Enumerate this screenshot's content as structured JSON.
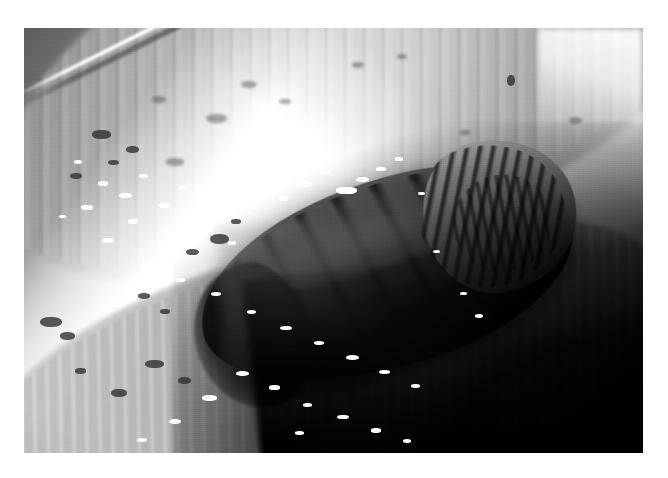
{
  "page": {
    "background_color": "#ffffff",
    "width": 668,
    "height": 478
  },
  "photo": {
    "alt_text": "Grayscale macro photograph of an insect pupa lying in a plant leaf sheath",
    "subject": "insect pupa",
    "medium": "black and white macro photograph",
    "frame": {
      "left": 24,
      "top": 28,
      "width": 619,
      "height": 425
    },
    "colors": {
      "paper": "#ffffff",
      "highlight": "#ffffff",
      "leaf_mid": "#b4b4b4",
      "leaf_dark": "#5d5d5d",
      "pupa_body": "#6e6e6e",
      "pupa_groove": "#141414",
      "shadow": "#000000"
    },
    "regions": [
      {
        "name": "upper-leaf-blade",
        "tone": "mid gray, blurred, longitudinal striations"
      },
      {
        "name": "leaf-edge-highlight",
        "tone": "bright white rim line running diagonally"
      },
      {
        "name": "blown-highlight-band",
        "tone": "overexposed white band, left of centre"
      },
      {
        "name": "pupa",
        "tone": "segmented dark gray body, head to upper right"
      },
      {
        "name": "lower-leaf-sheath",
        "tone": "mid gray with white speckles"
      },
      {
        "name": "shadow-wedge",
        "tone": "deep black, lower right corner"
      }
    ],
    "specular_highlights": [
      {
        "x": 44.0,
        "y": 36.0,
        "w": 2.6,
        "h": 1.5
      },
      {
        "x": 47.8,
        "y": 33.2,
        "w": 1.8,
        "h": 1.2
      },
      {
        "x": 50.4,
        "y": 37.4,
        "w": 3.4,
        "h": 1.7
      },
      {
        "x": 53.6,
        "y": 35.0,
        "w": 2.2,
        "h": 1.3
      },
      {
        "x": 56.8,
        "y": 32.6,
        "w": 1.7,
        "h": 1.1
      },
      {
        "x": 41.2,
        "y": 39.6,
        "w": 1.5,
        "h": 1.0
      },
      {
        "x": 60.0,
        "y": 30.4,
        "w": 1.3,
        "h": 0.9
      },
      {
        "x": 63.6,
        "y": 38.6,
        "w": 1.2,
        "h": 0.8
      },
      {
        "x": 37.0,
        "y": 42.0,
        "w": 1.1,
        "h": 0.8
      }
    ],
    "leaf_dew": [
      {
        "x": 12.0,
        "y": 36.0,
        "w": 1.6,
        "h": 1.1
      },
      {
        "x": 15.4,
        "y": 38.8,
        "w": 2.1,
        "h": 1.2
      },
      {
        "x": 18.6,
        "y": 34.4,
        "w": 1.4,
        "h": 1.0
      },
      {
        "x": 21.8,
        "y": 41.2,
        "w": 1.8,
        "h": 1.1
      },
      {
        "x": 25.0,
        "y": 37.0,
        "w": 1.3,
        "h": 0.9
      },
      {
        "x": 9.2,
        "y": 41.6,
        "w": 1.9,
        "h": 1.2
      },
      {
        "x": 28.4,
        "y": 43.8,
        "w": 1.5,
        "h": 1.0
      },
      {
        "x": 31.6,
        "y": 39.2,
        "w": 1.2,
        "h": 0.8
      },
      {
        "x": 16.8,
        "y": 45.0,
        "w": 1.6,
        "h": 1.0
      },
      {
        "x": 22.4,
        "y": 47.6,
        "w": 1.4,
        "h": 0.9
      },
      {
        "x": 12.6,
        "y": 49.4,
        "w": 2.0,
        "h": 1.1
      },
      {
        "x": 27.0,
        "y": 52.0,
        "w": 1.5,
        "h": 1.0
      },
      {
        "x": 33.0,
        "y": 50.2,
        "w": 1.2,
        "h": 0.8
      },
      {
        "x": 19.0,
        "y": 55.4,
        "w": 1.8,
        "h": 1.1
      },
      {
        "x": 24.6,
        "y": 58.8,
        "w": 1.4,
        "h": 0.9
      },
      {
        "x": 30.2,
        "y": 62.0,
        "w": 1.7,
        "h": 1.0
      },
      {
        "x": 36.0,
        "y": 66.4,
        "w": 1.5,
        "h": 1.0
      },
      {
        "x": 41.4,
        "y": 70.0,
        "w": 1.9,
        "h": 1.1
      },
      {
        "x": 46.8,
        "y": 73.6,
        "w": 1.6,
        "h": 1.0
      },
      {
        "x": 52.0,
        "y": 77.0,
        "w": 2.1,
        "h": 1.2
      },
      {
        "x": 57.4,
        "y": 80.4,
        "w": 1.7,
        "h": 1.0
      },
      {
        "x": 62.6,
        "y": 83.8,
        "w": 1.4,
        "h": 0.9
      },
      {
        "x": 34.2,
        "y": 80.6,
        "w": 2.2,
        "h": 1.2
      },
      {
        "x": 39.6,
        "y": 84.0,
        "w": 1.8,
        "h": 1.1
      },
      {
        "x": 28.8,
        "y": 86.4,
        "w": 2.4,
        "h": 1.3
      },
      {
        "x": 45.0,
        "y": 88.2,
        "w": 1.5,
        "h": 0.9
      },
      {
        "x": 50.6,
        "y": 91.0,
        "w": 1.9,
        "h": 1.1
      },
      {
        "x": 23.4,
        "y": 92.0,
        "w": 2.0,
        "h": 1.2
      },
      {
        "x": 56.0,
        "y": 94.2,
        "w": 1.6,
        "h": 1.0
      },
      {
        "x": 18.2,
        "y": 96.4,
        "w": 1.7,
        "h": 1.0
      },
      {
        "x": 61.2,
        "y": 96.8,
        "w": 1.3,
        "h": 0.9
      },
      {
        "x": 43.8,
        "y": 94.8,
        "w": 1.4,
        "h": 0.9
      },
      {
        "x": 66.0,
        "y": 52.2,
        "w": 1.2,
        "h": 0.8
      },
      {
        "x": 70.4,
        "y": 62.0,
        "w": 1.1,
        "h": 0.8
      },
      {
        "x": 72.8,
        "y": 67.4,
        "w": 1.3,
        "h": 0.9
      },
      {
        "x": 8.0,
        "y": 31.0,
        "w": 1.4,
        "h": 0.9
      },
      {
        "x": 5.6,
        "y": 44.0,
        "w": 1.2,
        "h": 0.8
      }
    ],
    "dark_specks": [
      {
        "x": 11.0,
        "y": 24.0,
        "w": 3.0,
        "h": 2.0,
        "soft": false
      },
      {
        "x": 16.4,
        "y": 27.8,
        "w": 2.2,
        "h": 1.6,
        "soft": false
      },
      {
        "x": 23.0,
        "y": 30.6,
        "w": 2.8,
        "h": 1.8,
        "soft": true
      },
      {
        "x": 29.4,
        "y": 20.2,
        "w": 3.4,
        "h": 2.2,
        "soft": true
      },
      {
        "x": 35.0,
        "y": 12.4,
        "w": 2.6,
        "h": 1.8,
        "soft": true
      },
      {
        "x": 41.2,
        "y": 16.6,
        "w": 2.0,
        "h": 1.4,
        "soft": true
      },
      {
        "x": 20.6,
        "y": 16.0,
        "w": 2.4,
        "h": 1.7,
        "soft": true
      },
      {
        "x": 7.4,
        "y": 34.2,
        "w": 2.0,
        "h": 1.4,
        "soft": false
      },
      {
        "x": 13.6,
        "y": 31.0,
        "w": 1.8,
        "h": 1.3,
        "soft": false
      },
      {
        "x": 30.0,
        "y": 48.4,
        "w": 3.2,
        "h": 2.4,
        "soft": false
      },
      {
        "x": 26.2,
        "y": 52.0,
        "w": 2.0,
        "h": 1.5,
        "soft": false
      },
      {
        "x": 33.4,
        "y": 45.0,
        "w": 1.6,
        "h": 1.2,
        "soft": false
      },
      {
        "x": 2.6,
        "y": 68.0,
        "w": 3.6,
        "h": 2.4,
        "soft": false
      },
      {
        "x": 5.8,
        "y": 71.6,
        "w": 2.4,
        "h": 1.8,
        "soft": false
      },
      {
        "x": 18.4,
        "y": 62.4,
        "w": 2.0,
        "h": 1.4,
        "soft": false
      },
      {
        "x": 22.0,
        "y": 66.0,
        "w": 1.6,
        "h": 1.2,
        "soft": false
      },
      {
        "x": 19.6,
        "y": 78.0,
        "w": 3.0,
        "h": 2.0,
        "soft": false
      },
      {
        "x": 24.8,
        "y": 82.2,
        "w": 2.2,
        "h": 1.6,
        "soft": false
      },
      {
        "x": 14.0,
        "y": 85.0,
        "w": 2.6,
        "h": 1.8,
        "soft": false
      },
      {
        "x": 8.2,
        "y": 80.0,
        "w": 1.8,
        "h": 1.3,
        "soft": false
      },
      {
        "x": 53.0,
        "y": 8.0,
        "w": 2.0,
        "h": 1.4,
        "soft": true
      },
      {
        "x": 78.0,
        "y": 11.0,
        "w": 1.4,
        "h": 2.6,
        "soft": false
      },
      {
        "x": 70.4,
        "y": 24.0,
        "w": 1.6,
        "h": 1.2,
        "soft": true
      },
      {
        "x": 88.0,
        "y": 21.0,
        "w": 2.2,
        "h": 1.6,
        "soft": true
      },
      {
        "x": 60.2,
        "y": 6.0,
        "w": 1.6,
        "h": 1.2,
        "soft": true
      }
    ]
  }
}
